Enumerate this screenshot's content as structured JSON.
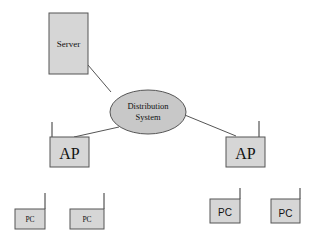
{
  "diagram": {
    "server": {
      "label": "Server"
    },
    "distribution_system": {
      "line1": "Distribution",
      "line2": "System"
    },
    "access_points": [
      {
        "label": "AP"
      },
      {
        "label": "AP"
      }
    ],
    "stations": [
      {
        "label": "PC"
      },
      {
        "label": "PC"
      },
      {
        "label": "PC"
      },
      {
        "label": "PC"
      }
    ]
  },
  "colors": {
    "box_fill": "#d6d6d6",
    "ellipse_fill": "#c8c8c8",
    "stroke": "#555555"
  }
}
